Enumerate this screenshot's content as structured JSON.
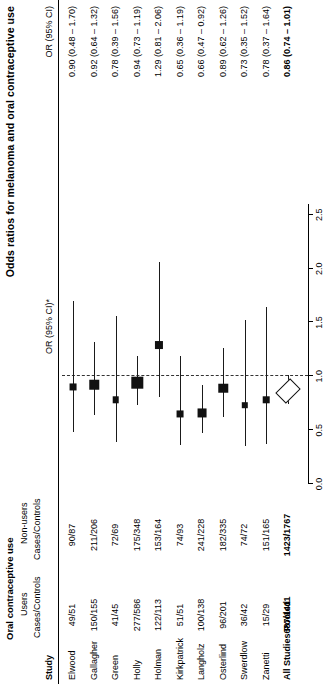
{
  "header": {
    "plot_title": "Odds ratios for melanoma and oral contraceptive use",
    "group_title": "Oral contraceptive use",
    "col_study": "Study",
    "col_users_1": "Users",
    "col_users_2": "Cases/Controls",
    "col_nonusers_1": "Non-users",
    "col_nonusers_2": "Cases/Controls",
    "col_plot_or": "OR (95% CI)*",
    "col_table_or": "OR (95% CI)"
  },
  "axis": {
    "ticks": [
      "0.0",
      "0.5",
      "1.0",
      "1.5",
      "2.0",
      "2.5"
    ],
    "tick_values": [
      0.0,
      0.5,
      1.0,
      1.5,
      2.0,
      2.5
    ],
    "min": 0.0,
    "max": 2.6,
    "null_value": 1.0
  },
  "chart_data": {
    "type": "forest",
    "title": "Odds ratios for melanoma and oral contraceptive use",
    "xlabel": "OR (95% CI)*",
    "ylabel": "Study",
    "xlim": [
      0.0,
      2.6
    ],
    "xticks": [
      0.0,
      0.5,
      1.0,
      1.5,
      2.0,
      2.5
    ],
    "null_line": 1.0,
    "grid": false,
    "legend": "none",
    "columns": [
      "Study",
      "Users Cases/Controls",
      "Non-users Cases/Controls",
      "OR (95% CI)"
    ],
    "rows": [
      {
        "study": "Elwood",
        "users": "49/51",
        "nonusers": "90/87",
        "or_text": "0.90 (0.48 – 1.70)",
        "or": 0.9,
        "lo": 0.48,
        "hi": 1.7,
        "weight": 0.3,
        "pooled": false
      },
      {
        "study": "Gallagher",
        "users": "150/155",
        "nonusers": "211/206",
        "or_text": "0.92 (0.64 – 1.32)",
        "or": 0.92,
        "lo": 0.64,
        "hi": 1.32,
        "weight": 0.62,
        "pooled": false
      },
      {
        "study": "Green",
        "users": "41/45",
        "nonusers": "72/69",
        "or_text": "0.78 (0.39 – 1.56)",
        "or": 0.78,
        "lo": 0.39,
        "hi": 1.56,
        "weight": 0.26,
        "pooled": false
      },
      {
        "study": "Holly",
        "users": "277/586",
        "nonusers": "175/348",
        "or_text": "0.94 (0.73 – 1.19)",
        "or": 0.94,
        "lo": 0.73,
        "hi": 1.19,
        "weight": 0.86,
        "pooled": false
      },
      {
        "study": "Holman",
        "users": "122/113",
        "nonusers": "153/164",
        "or_text": "1.29 (0.81 – 2.06)",
        "or": 1.29,
        "lo": 0.81,
        "hi": 2.06,
        "weight": 0.45,
        "pooled": false
      },
      {
        "study": "Kirkpatrick",
        "users": "51/51",
        "nonusers": "74/93",
        "or_text": "0.65 (0.36 – 1.19)",
        "or": 0.65,
        "lo": 0.36,
        "hi": 1.19,
        "weight": 0.3,
        "pooled": false
      },
      {
        "study": "Langholz",
        "users": "100/138",
        "nonusers": "241/228",
        "or_text": "0.66 (0.47 – 0.92)",
        "or": 0.66,
        "lo": 0.47,
        "hi": 0.92,
        "weight": 0.55,
        "pooled": false
      },
      {
        "study": "Osterlind",
        "users": "96/201",
        "nonusers": "182/335",
        "or_text": "0.89 (0.62 – 1.26)",
        "or": 0.89,
        "lo": 0.62,
        "hi": 1.26,
        "weight": 0.62,
        "pooled": false
      },
      {
        "study": "Swerdlow",
        "users": "36/42",
        "nonusers": "74/72",
        "or_text": "0.73 (0.35 – 1.52)",
        "or": 0.73,
        "lo": 0.35,
        "hi": 1.52,
        "weight": 0.24,
        "pooled": false
      },
      {
        "study": "Zanetti",
        "users": "15/29",
        "nonusers": "151/165",
        "or_text": "0.78 (0.37 – 1.64)",
        "or": 0.78,
        "lo": 0.37,
        "hi": 1.64,
        "weight": 0.26,
        "pooled": false
      },
      {
        "study": "All Studies Pooled",
        "users": "687/1411",
        "nonusers": "1423/1767",
        "or_text": "0.86 (0.74 – 1.01)",
        "or": 0.86,
        "lo": 0.74,
        "hi": 1.01,
        "weight": 1.0,
        "pooled": true
      }
    ]
  }
}
